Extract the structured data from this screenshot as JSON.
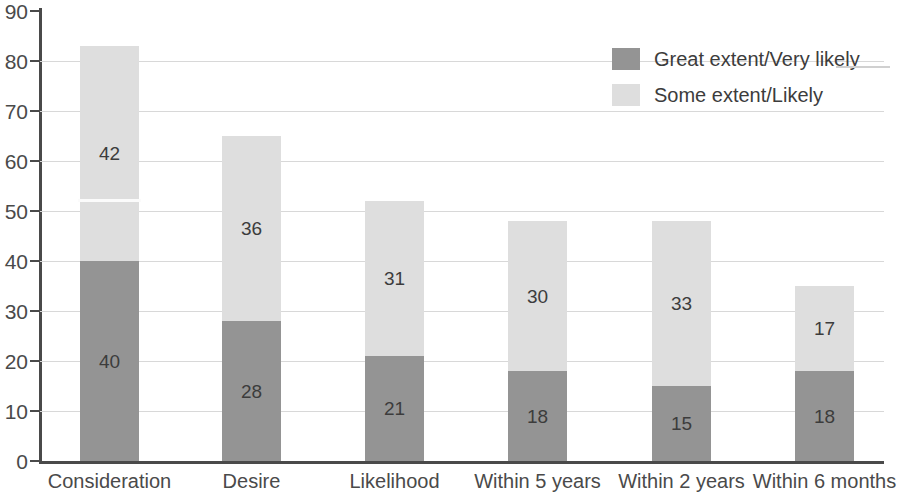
{
  "chart_data": {
    "type": "bar",
    "subtype": "stacked-vertical",
    "title": "",
    "xlabel": "",
    "ylabel": "",
    "ylim": [
      0,
      90
    ],
    "ytick_step": 10,
    "ytick_labels": [
      "90",
      "80",
      "70",
      "60",
      "50",
      "40",
      "30",
      "20",
      "10",
      "0"
    ],
    "grid": true,
    "grid_axis": "y",
    "legend_position": "top-right",
    "categories": [
      "Consideration",
      "Desire",
      "Likelihood",
      "Within 5 years",
      "Within 2 years",
      "Within 6 months"
    ],
    "series": [
      {
        "name": "Great extent/Very likely",
        "color": "#949494",
        "values": [
          40,
          28,
          21,
          18,
          15,
          18
        ],
        "labels": [
          "40",
          "28",
          "21",
          "18",
          "15",
          "18"
        ]
      },
      {
        "name": "Some extent/Likely",
        "color": "#dedede",
        "values": [
          42,
          36,
          31,
          30,
          33,
          17
        ],
        "labels": [
          "42",
          "36",
          "31",
          "30",
          "33",
          "17"
        ]
      }
    ],
    "totals": [
      83,
      65,
      52,
      48,
      48,
      35
    ],
    "bar_pixel_tops": [
      48,
      136,
      198,
      221,
      221,
      286
    ],
    "bar_split_pixel": [
      262,
      333,
      355,
      371,
      386,
      371
    ]
  },
  "axis": {
    "y_ticks": [
      {
        "label": "90",
        "value": 90
      },
      {
        "label": "80",
        "value": 80
      },
      {
        "label": "70",
        "value": 70
      },
      {
        "label": "60",
        "value": 60
      },
      {
        "label": "50",
        "value": 50
      },
      {
        "label": "40",
        "value": 40
      },
      {
        "label": "30",
        "value": 30
      },
      {
        "label": "20",
        "value": 20
      },
      {
        "label": "10",
        "value": 10
      },
      {
        "label": "0",
        "value": 0
      }
    ]
  },
  "legend": {
    "items": [
      {
        "label": "Great extent/Very likely",
        "swatch": "dark"
      },
      {
        "label": "Some extent/Likely",
        "swatch": "light"
      }
    ]
  },
  "colors": {
    "series_dark": "#949494",
    "series_light": "#dedede",
    "axis": "#4a4a4a",
    "gridline": "#d8d8d8",
    "text": "#3c3c3c",
    "background": "#ffffff"
  }
}
